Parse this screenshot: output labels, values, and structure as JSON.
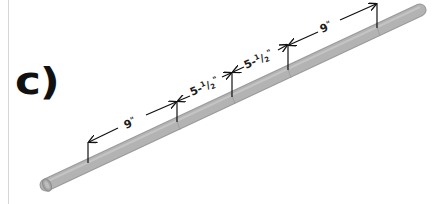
{
  "figure": {
    "panel_label": "c)",
    "colors": {
      "pipe": "#b3b3b3",
      "pipe_edge": "#9a9a9a",
      "ink": "#111111",
      "border": "#d6d6d6"
    },
    "dimensions": [
      {
        "label": "9\"",
        "whole": "9",
        "unit": "\""
      },
      {
        "label": "5-1/2\"",
        "whole": "5-",
        "num": "1",
        "den": "2",
        "unit": "\""
      },
      {
        "label": "5-1/2\"",
        "whole": "5-",
        "num": "1",
        "den": "2",
        "unit": "\""
      },
      {
        "label": "9\"",
        "whole": "9",
        "unit": "\""
      }
    ]
  }
}
